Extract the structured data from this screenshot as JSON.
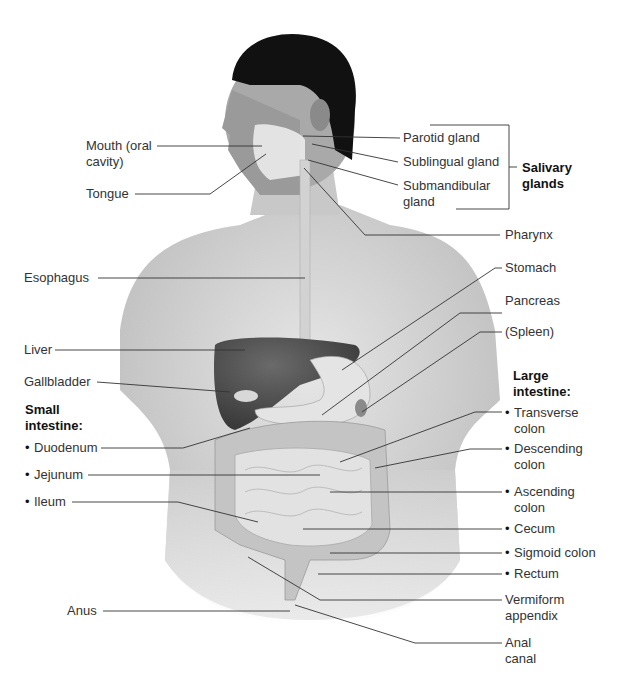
{
  "figure": {
    "colors": {
      "background": "#ffffff",
      "skin": "#d9d9d9",
      "hair": "#111111",
      "liver": "#4a4a4a",
      "gland": "#efefef",
      "intestine": "#c9c9c9",
      "leader_line": "#333333",
      "label_text": "#333333"
    }
  },
  "labels": {
    "mouth": "Mouth (oral\ncavity)",
    "tongue": "Tongue",
    "esophagus": "Esophagus",
    "liver": "Liver",
    "gallbladder": "Gallbladder",
    "small_intestine_heading": "Small\nintestine:",
    "duodenum": "Duodenum",
    "jejunum": "Jejunum",
    "ileum": "Ileum",
    "anus": "Anus",
    "parotid": "Parotid gland",
    "sublingual": "Sublingual gland",
    "submandibular": "Submandibular\ngland",
    "salivary_heading": "Salivary\nglands",
    "pharynx": "Pharynx",
    "stomach": "Stomach",
    "pancreas": "Pancreas",
    "spleen": "(Spleen)",
    "large_intestine_heading": "Large\nintestine:",
    "transverse": "Transverse",
    "transverse2": "colon",
    "descending": "Descending",
    "descending2": "colon",
    "ascending": "Ascending",
    "ascending2": "colon",
    "cecum": "Cecum",
    "sigmoid": "Sigmoid colon",
    "rectum": "Rectum",
    "appendix": "Vermiform\nappendix",
    "anal_canal": "Anal\ncanal"
  }
}
